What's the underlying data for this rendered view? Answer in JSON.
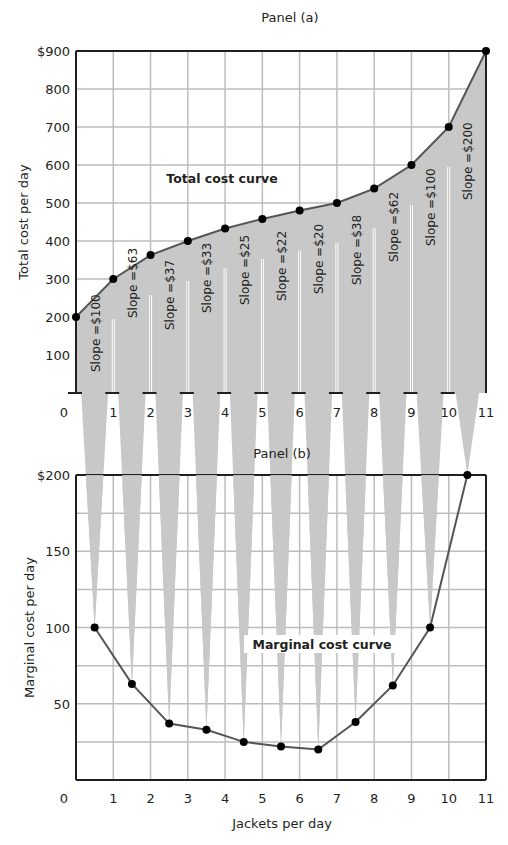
{
  "chart_data": [
    {
      "type": "line",
      "panel": "Panel (a)",
      "title": "Panel (a)",
      "xlabel": "",
      "ylabel": "Total cost per day",
      "x": [
        0,
        1,
        2,
        3,
        4,
        5,
        6,
        7,
        8,
        9,
        10,
        11
      ],
      "series": [
        {
          "name": "Total cost curve",
          "values": [
            200,
            300,
            363,
            400,
            433,
            458,
            480,
            500,
            538,
            600,
            700,
            900
          ]
        }
      ],
      "annotations": [
        "Slope =$100",
        "Slope =$63",
        "Slope =$37",
        "Slope =$33",
        "Slope =$25",
        "Slope =$22",
        "Slope =$20",
        "Slope =$38",
        "Slope =$62",
        "Slope =$100",
        "Slope =$200"
      ],
      "xlim": [
        0,
        11
      ],
      "ylim": [
        0,
        900
      ],
      "yticks": [
        "100",
        "200",
        "300",
        "400",
        "500",
        "600",
        "700",
        "800",
        "$900"
      ],
      "xticks": [
        "0",
        "1",
        "2",
        "3",
        "4",
        "5",
        "6",
        "7",
        "8",
        "9",
        "10",
        "11"
      ],
      "grid": true,
      "curve_label": "Total cost curve"
    },
    {
      "type": "line",
      "panel": "Panel (b)",
      "title": "Panel (b)",
      "xlabel": "Jackets per day",
      "ylabel": "Marginal cost per day",
      "x": [
        0.5,
        1.5,
        2.5,
        3.5,
        4.5,
        5.5,
        6.5,
        7.5,
        8.5,
        9.5,
        10.5
      ],
      "series": [
        {
          "name": "Marginal cost curve",
          "values": [
            100,
            63,
            37,
            33,
            25,
            22,
            20,
            38,
            62,
            100,
            200
          ]
        }
      ],
      "xlim": [
        0,
        11
      ],
      "ylim": [
        0,
        200
      ],
      "yticks": [
        "50",
        "100",
        "150",
        "$200"
      ],
      "xticks": [
        "0",
        "1",
        "2",
        "3",
        "4",
        "5",
        "6",
        "7",
        "8",
        "9",
        "10",
        "11"
      ],
      "grid": true,
      "curve_label": "Marginal cost curve"
    }
  ],
  "colors": {
    "line": "#555555",
    "marker": "#000000",
    "fill": "#c8c8c8",
    "grid": "#bdbdbd",
    "axis": "#231f20"
  }
}
